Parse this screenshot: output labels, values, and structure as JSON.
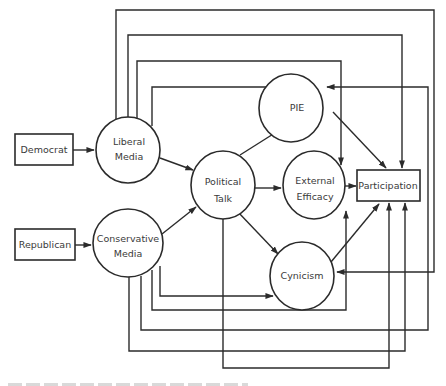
{
  "diagram": {
    "type": "path-model",
    "nodes": {
      "democrat": {
        "label": "Democrat",
        "shape": "rect"
      },
      "republican": {
        "label": "Republican",
        "shape": "rect"
      },
      "liberal_media": {
        "line1": "Liberal",
        "line2": "Media",
        "shape": "ellipse"
      },
      "conservative_media": {
        "line1": "Conservative",
        "line2": "Media",
        "shape": "ellipse"
      },
      "political_talk": {
        "line1": "Political",
        "line2": "Talk",
        "shape": "ellipse"
      },
      "pie": {
        "label": "PIE",
        "shape": "ellipse"
      },
      "external_efficacy": {
        "line1": "External",
        "line2": "Efficacy",
        "shape": "ellipse"
      },
      "cynicism": {
        "label": "Cynicism",
        "shape": "ellipse"
      },
      "participation": {
        "label": "Participation",
        "shape": "rect"
      }
    },
    "edges": [
      {
        "from": "Democrat",
        "to": "Liberal Media"
      },
      {
        "from": "Republican",
        "to": "Conservative Media"
      },
      {
        "from": "Liberal Media",
        "to": "Political Talk"
      },
      {
        "from": "Conservative Media",
        "to": "Political Talk"
      },
      {
        "from": "Liberal Media",
        "to": "PIE"
      },
      {
        "from": "Liberal Media",
        "to": "External Efficacy"
      },
      {
        "from": "Liberal Media",
        "to": "Participation"
      },
      {
        "from": "Liberal Media",
        "to": "Cynicism"
      },
      {
        "from": "Conservative Media",
        "to": "Cynicism"
      },
      {
        "from": "Conservative Media",
        "to": "External Efficacy"
      },
      {
        "from": "Conservative Media",
        "to": "PIE"
      },
      {
        "from": "Conservative Media",
        "to": "Participation"
      },
      {
        "from": "Political Talk",
        "to": "PIE"
      },
      {
        "from": "Political Talk",
        "to": "External Efficacy"
      },
      {
        "from": "Political Talk",
        "to": "Cynicism"
      },
      {
        "from": "Political Talk",
        "to": "Participation"
      },
      {
        "from": "PIE",
        "to": "Participation"
      },
      {
        "from": "External Efficacy",
        "to": "Participation"
      },
      {
        "from": "Cynicism",
        "to": "Participation"
      }
    ],
    "colors": {
      "stroke": "#2b2b2b",
      "text": "#3a3a3a",
      "background": "#ffffff"
    }
  }
}
